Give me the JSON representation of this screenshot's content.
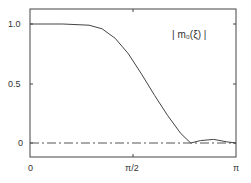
{
  "chart_data": {
    "type": "line",
    "title": "",
    "annotation": "| m₀(ξ) |",
    "xlabel": "",
    "ylabel": "",
    "xlim": [
      0,
      3.14159
    ],
    "ylim": [
      -0.15,
      1.1
    ],
    "x_tick_labels": [
      "0",
      "π/2",
      "π"
    ],
    "y_tick_labels": [
      "0",
      "0.5",
      "1.0"
    ],
    "grid": false,
    "legend": "none",
    "series": [
      {
        "name": "|m0(ξ)|",
        "style": "solid",
        "x": [
          0,
          0.5,
          0.9,
          1.1,
          1.3,
          1.5,
          1.7,
          1.9,
          2.1,
          2.3,
          2.45,
          2.6,
          2.8,
          3.0,
          3.14
        ],
        "y": [
          1.0,
          1.0,
          0.99,
          0.96,
          0.88,
          0.75,
          0.58,
          0.4,
          0.23,
          0.08,
          0.0,
          0.02,
          0.03,
          0.01,
          0.0
        ]
      },
      {
        "name": "zero line",
        "style": "dash-dot",
        "x": [
          0,
          3.14
        ],
        "y": [
          0,
          0
        ]
      }
    ]
  }
}
